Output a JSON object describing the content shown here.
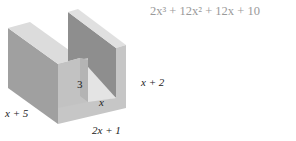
{
  "expression": "2x³ + 12x² + 12x + 10",
  "labels": {
    "height": "3",
    "slot_width": "x",
    "depth": "x + 5",
    "width": "2x + 1",
    "wall_height": "x + 2"
  },
  "colors": {
    "front": "#c8c8c8",
    "side": "#9c9c9c",
    "top": "#dedede",
    "slot_floor": "#e2e2e2",
    "expression": "#9a9a9a"
  }
}
